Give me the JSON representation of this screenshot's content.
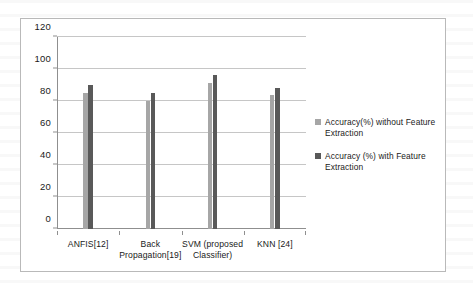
{
  "chart_data": {
    "type": "bar",
    "title": "",
    "xlabel": "",
    "ylabel": "",
    "ylim": [
      0,
      120
    ],
    "yticks": [
      0,
      20,
      40,
      60,
      80,
      100,
      120
    ],
    "grid": true,
    "legend_position": "right",
    "categories": [
      "ANFIS[12]",
      "Back Propagation[19]",
      "SVM (proposed Classifier)",
      "KNN [24]"
    ],
    "category_lines": [
      [
        "ANFIS[12]"
      ],
      [
        "Back",
        "Propagation[19]"
      ],
      [
        "SVM (proposed",
        "Classifier)"
      ],
      [
        "KNN [24]"
      ]
    ],
    "series": [
      {
        "name": "Accuracy(%) without Feature Extraction",
        "color": "#a6a6a6",
        "values": [
          85,
          80,
          91,
          84
        ]
      },
      {
        "name": "Accuracy (%) with Feature Extraction",
        "color": "#595959",
        "values": [
          90,
          85,
          96,
          88
        ]
      }
    ]
  },
  "legend": {
    "items": [
      {
        "label": "Accuracy(%) without Feature Extraction",
        "color": "#a6a6a6"
      },
      {
        "label": "Accuracy (%) with Feature Extraction",
        "color": "#595959"
      }
    ]
  }
}
